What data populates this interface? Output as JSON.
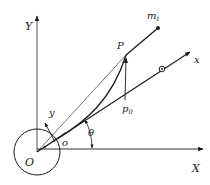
{
  "diagram": {
    "colors": {
      "stroke": "#1a1a1a",
      "axis_gray": "#555555",
      "background": "#ffffff"
    },
    "labels": {
      "Y_axis": "Y",
      "X_axis": "X",
      "x_axis": "x",
      "y_axis": "y",
      "origin_O": "O",
      "origin_o": "o",
      "angle": "θ",
      "point_P": "P",
      "point_p0": "p",
      "point_p0_sub": "0",
      "mass": "m",
      "mass_sub": "t"
    },
    "elements": [
      {
        "id": "global-frame",
        "type": "axes",
        "axes": [
          "X",
          "Y"
        ],
        "origin": "O"
      },
      {
        "id": "hub-circle",
        "type": "circle",
        "center": "O"
      },
      {
        "id": "rotating-frame",
        "type": "axes",
        "axes": [
          "x",
          "y"
        ],
        "origin": "o",
        "rotation": "θ"
      },
      {
        "id": "marker",
        "type": "small-circle",
        "on": "x"
      },
      {
        "id": "deflected-beam",
        "type": "curve",
        "from": "o",
        "to": "P"
      },
      {
        "id": "tip-mass",
        "type": "point",
        "label": "m_t"
      },
      {
        "id": "deflection",
        "type": "vector",
        "from": "p0",
        "to": "P"
      }
    ]
  }
}
